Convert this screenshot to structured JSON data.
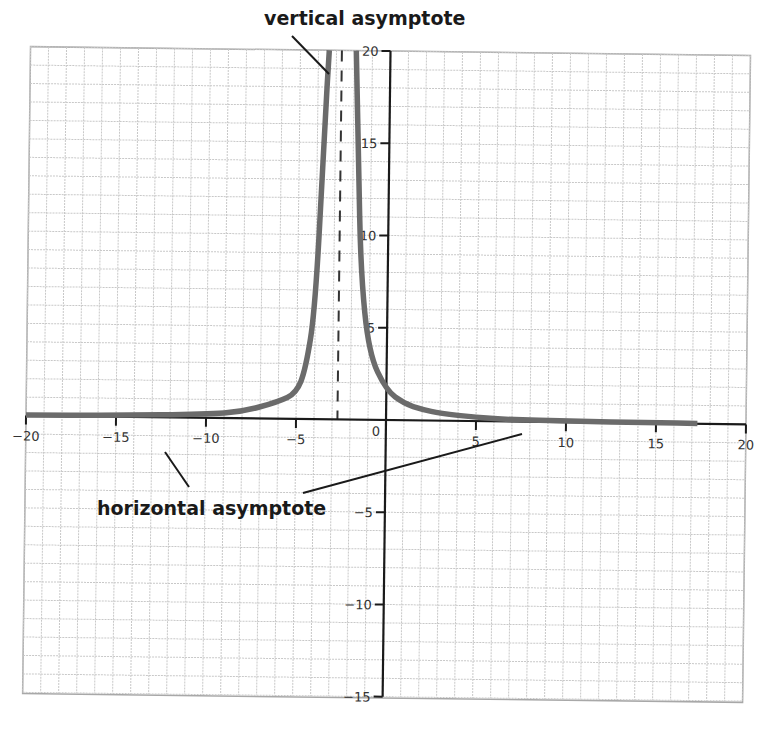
{
  "chart_data": {
    "type": "line",
    "title": "",
    "xlabel": "",
    "ylabel": "",
    "xlim": [
      -20,
      20
    ],
    "ylim": [
      -15,
      20
    ],
    "grid": true,
    "x_ticks": [
      -20,
      -15,
      -10,
      -5,
      0,
      5,
      10,
      15,
      20
    ],
    "x_tick_labels": [
      "−20",
      "−15",
      "−10",
      "−5",
      "0",
      "5",
      "10",
      "15",
      "20"
    ],
    "y_ticks": [
      -15,
      -10,
      -5,
      5,
      10,
      15,
      20
    ],
    "y_tick_labels": [
      "−15",
      "−10",
      "−5",
      "5",
      "10",
      "15",
      "20"
    ],
    "series": [
      {
        "name": "f(x)",
        "description": "rational function with vertical asymptote near x = -2.7 and horizontal asymptote y = 0",
        "color": "#6b6b6b",
        "x": [
          -20,
          -15,
          -10,
          -8,
          -6,
          -5,
          -4.5,
          -4,
          -3.6,
          -3.4,
          -1.9,
          -1.7,
          -1.5,
          -1,
          0,
          1,
          2,
          3,
          5,
          7,
          10,
          15,
          17.3
        ],
        "y": [
          0.04,
          0.07,
          0.19,
          0.35,
          0.92,
          1.4,
          2.7,
          6.0,
          16.0,
          20,
          20,
          14.0,
          8.0,
          3.6,
          1.6,
          0.9,
          0.6,
          0.4,
          0.2,
          0.1,
          0.06,
          0.03,
          0.02
        ]
      }
    ],
    "asymptotes": [
      {
        "type": "vertical",
        "x": -2.7,
        "style": "dashed"
      },
      {
        "type": "horizontal",
        "y": 0
      }
    ],
    "annotations": [
      {
        "text": "vertical asymptote",
        "points_to": "dashed line near x = -2.7"
      },
      {
        "text": "horizontal asymptote",
        "points_to": "x-axis (y = 0) on both sides"
      }
    ]
  },
  "labels": {
    "vertical_asymptote": "vertical asymptote",
    "horizontal_asymptote": "horizontal asymptote",
    "origin": "0"
  },
  "colors": {
    "curve": "#6b6b6b",
    "axis": "#1a1a1a",
    "grid": "#c8c8c8",
    "frame": "#a0a0a0"
  }
}
